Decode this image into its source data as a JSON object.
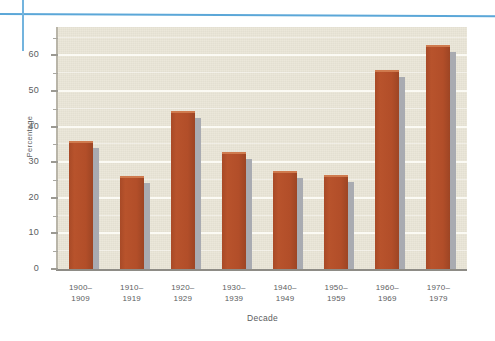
{
  "decorations": {
    "horizontal_rule_color": "#5ba7d8",
    "vertical_rule_color": "#73b4de"
  },
  "colors": {
    "plot_background": "#e9e5d6",
    "bar_fill": "#b5502a",
    "bar_shadow": "#a9abb1",
    "gridline": "#fbfaf4",
    "axis_text": "#5b5c60"
  },
  "chart_data": {
    "type": "bar",
    "title": "",
    "xlabel": "Decade",
    "ylabel": "Percentage",
    "categories": [
      "1900–1909",
      "1910–1919",
      "1920–1929",
      "1930–1939",
      "1940–1949",
      "1950–1959",
      "1960–1969",
      "1970–1979"
    ],
    "category_lines": [
      [
        "1900–",
        "1909"
      ],
      [
        "1910–",
        "1919"
      ],
      [
        "1920–",
        "1929"
      ],
      [
        "1930–",
        "1939"
      ],
      [
        "1940–",
        "1949"
      ],
      [
        "1950–",
        "1959"
      ],
      [
        "1960–",
        "1969"
      ],
      [
        "1970–",
        "1979"
      ]
    ],
    "values": [
      36,
      26,
      44.5,
      33,
      27.5,
      26.5,
      56,
      63
    ],
    "ylim": [
      0,
      68
    ],
    "ytick_values": [
      0,
      10,
      20,
      30,
      40,
      50,
      60
    ],
    "ytick_labels": [
      "0",
      "10",
      "20",
      "30",
      "40",
      "50",
      "60"
    ],
    "yminor_tick_values": [
      5,
      15,
      25,
      35,
      45,
      55,
      65
    ],
    "grid": "horizontal",
    "legend": "none",
    "bar_style": "solid-with-right-shadow"
  }
}
